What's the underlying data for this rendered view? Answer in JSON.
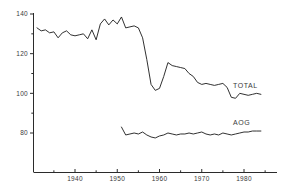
{
  "chart_data": {
    "type": "line",
    "title": "",
    "subtitle": "",
    "xlabel": "",
    "ylabel": "",
    "xlim": [
      1931,
      1985
    ],
    "ylim": [
      72,
      141
    ],
    "grid": false,
    "legend_position": "inline-right-end-of-line",
    "y_ticks_major": [
      80,
      100,
      120,
      140
    ],
    "y_ticks_minor": [
      90,
      110,
      130
    ],
    "y_tick_labels": [
      "80",
      "100",
      "120",
      "140"
    ],
    "x_ticks_major": [
      1940,
      1950,
      1960,
      1970,
      1980
    ],
    "x_ticks_minor": [
      1935,
      1945,
      1955,
      1965,
      1975,
      1985
    ],
    "x_tick_labels": [
      "1940",
      "1950",
      "1960",
      "1970",
      "1980"
    ],
    "series": [
      {
        "name": "TOTAL",
        "label": "TOTAL",
        "color": "#1a1a1a",
        "x": [
          1931,
          1932,
          1933,
          1934,
          1935,
          1936,
          1937,
          1938,
          1939,
          1940,
          1941,
          1942,
          1943,
          1944,
          1945,
          1946,
          1947,
          1948,
          1949,
          1950,
          1951,
          1952,
          1953,
          1954,
          1955,
          1956,
          1957,
          1958,
          1959,
          1960,
          1961,
          1962,
          1963,
          1964,
          1965,
          1966,
          1967,
          1968,
          1969,
          1970,
          1971,
          1972,
          1973,
          1974,
          1975,
          1976,
          1977,
          1978,
          1979,
          1980,
          1981,
          1982,
          1983,
          1984
        ],
        "values": [
          133.0,
          131.5,
          132.0,
          130.5,
          131.0,
          128.0,
          130.5,
          131.5,
          129.5,
          129.0,
          129.5,
          130.0,
          127.5,
          132.0,
          127.0,
          135.0,
          137.5,
          134.5,
          137.0,
          135.0,
          138.5,
          133.0,
          133.5,
          134.0,
          133.0,
          128.0,
          117.0,
          104.5,
          101.5,
          102.5,
          108.5,
          115.5,
          114.0,
          113.5,
          113.0,
          112.5,
          110.0,
          108.5,
          105.5,
          104.5,
          105.0,
          104.5,
          104.0,
          104.5,
          105.0,
          103.0,
          98.0,
          97.5,
          100.0,
          99.5,
          99.0,
          99.5,
          100.0,
          99.5
        ]
      },
      {
        "name": "AOG",
        "label": "AOG",
        "color": "#1a1a1a",
        "x": [
          1951,
          1952,
          1953,
          1954,
          1955,
          1956,
          1957,
          1958,
          1959,
          1960,
          1961,
          1962,
          1963,
          1964,
          1965,
          1966,
          1967,
          1968,
          1969,
          1970,
          1971,
          1972,
          1973,
          1974,
          1975,
          1976,
          1977,
          1978,
          1979,
          1980,
          1981,
          1982,
          1983,
          1984
        ],
        "values": [
          83.0,
          79.0,
          79.5,
          80.0,
          79.5,
          80.5,
          79.0,
          78.0,
          77.5,
          78.5,
          79.0,
          80.0,
          79.5,
          79.0,
          79.5,
          79.5,
          80.0,
          79.5,
          80.0,
          80.5,
          79.5,
          79.0,
          79.5,
          79.0,
          80.0,
          79.5,
          79.0,
          79.5,
          80.0,
          80.5,
          80.5,
          81.0,
          81.0,
          81.0
        ]
      }
    ]
  },
  "labels": {
    "total_label": "TOTAL",
    "aog_label": "AOG"
  }
}
